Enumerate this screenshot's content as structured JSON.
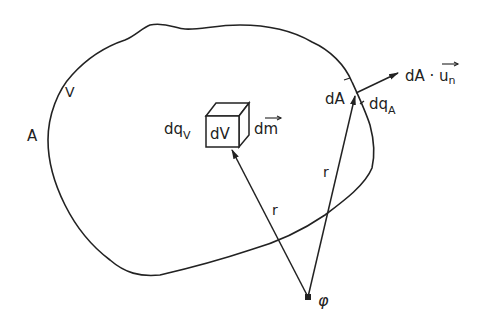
{
  "diagram": {
    "type": "volume-and-surface-charge-diagram",
    "labels": {
      "surface": "A",
      "volume": "V",
      "volume_charge": "dq",
      "volume_charge_sub": "V",
      "volume_element": "dV",
      "mass_element": "dm",
      "area_element": "dA",
      "surface_charge": "dq",
      "surface_charge_sub": "A",
      "normal_vector": "dA · u",
      "normal_vector_sub": "n",
      "distance_to_volume": "r",
      "distance_to_surface": "r",
      "potential_point": "φ"
    },
    "colors": {
      "stroke": "#222222",
      "background": "#ffffff"
    }
  }
}
